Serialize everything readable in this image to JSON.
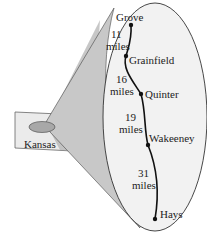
{
  "diagram": {
    "state_label": "Kansas",
    "towns": [
      {
        "name": "Grove"
      },
      {
        "name": "Grainfield"
      },
      {
        "name": "Quinter"
      },
      {
        "name": "Wakeeney"
      },
      {
        "name": "Hays"
      }
    ],
    "segments": [
      {
        "number": "11",
        "unit": "miles"
      },
      {
        "number": "16",
        "unit": "miles"
      },
      {
        "number": "19",
        "unit": "miles"
      },
      {
        "number": "31",
        "unit": "miles"
      }
    ],
    "colors": {
      "ellipse_fill": "#f2f2f2",
      "cone_fill": "#c8c8c8",
      "state_fill": "#ebebeb",
      "state_shaded": "#b4b4b4",
      "oval_fill": "#a8a8a8",
      "route": "#111111"
    }
  }
}
